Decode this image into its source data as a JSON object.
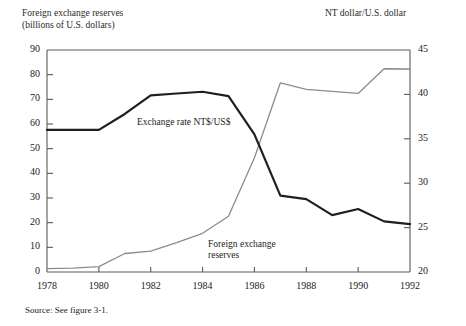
{
  "figure": {
    "left_axis_title_line1": "Foreign exchange reserves",
    "left_axis_title_line2": "(billions of U.S. dollars)",
    "right_axis_title": "NT dollar/U.S. dollar",
    "source_note": "Source: See figure 3-1.",
    "annotation_exchange_rate": "Exchange rate NT$/US$",
    "annotation_reserves_line1": "Foreign exchange",
    "annotation_reserves_line2": "reserves"
  },
  "chart_data": {
    "type": "line",
    "title": "",
    "xlabel": "",
    "ylabel": "Foreign exchange reserves (billions of U.S. dollars)",
    "y2label": "NT dollar/U.S. dollar",
    "grid": false,
    "legend": "inline-annotations",
    "x": [
      1978,
      1979,
      1980,
      1981,
      1982,
      1983,
      1984,
      1985,
      1986,
      1987,
      1988,
      1989,
      1990,
      1991,
      1992
    ],
    "xlim": [
      1978,
      1992
    ],
    "xticks": [
      1978,
      1980,
      1982,
      1984,
      1986,
      1988,
      1990,
      1992
    ],
    "xticklabels": [
      "1978",
      "1980",
      "1982",
      "1984",
      "1986",
      "1988",
      "1990",
      "1992"
    ],
    "ylim": [
      0,
      90
    ],
    "yticks": [
      0,
      10,
      20,
      30,
      40,
      50,
      60,
      70,
      80,
      90
    ],
    "yticklabels": [
      "0",
      "10",
      "20",
      "30",
      "40",
      "50",
      "60",
      "70",
      "80",
      "90"
    ],
    "y2lim": [
      20,
      45
    ],
    "y2ticks": [
      20,
      25,
      30,
      35,
      40,
      45
    ],
    "y2ticklabels": [
      "20",
      "25",
      "30",
      "35",
      "40",
      "45"
    ],
    "series": [
      {
        "name": "Foreign exchange reserves",
        "axis": "left",
        "color": "#8c8c8c",
        "width": 1.3,
        "units": "billions of U.S. dollars",
        "values": [
          1.4,
          1.6,
          2.2,
          7.5,
          8.5,
          11.9,
          15.7,
          22.6,
          46.3,
          76.7,
          74.0,
          73.2,
          72.4,
          82.4,
          82.3
        ]
      },
      {
        "name": "Exchange rate NT$/US$",
        "axis": "right",
        "color": "#1f1f1f",
        "width": 2.2,
        "units": "NT dollar per U.S. dollar",
        "values": [
          36.0,
          36.0,
          36.0,
          37.8,
          39.9,
          40.1,
          40.3,
          39.8,
          35.5,
          28.6,
          28.2,
          26.4,
          27.1,
          25.7,
          25.4
        ]
      }
    ],
    "annotations": [
      {
        "text": "Exchange rate NT$/US$",
        "x": 1983.4,
        "y2": 37.2
      },
      {
        "text": "Foreign exchange reserves",
        "x": 1985.8,
        "y": 16.0
      }
    ]
  }
}
